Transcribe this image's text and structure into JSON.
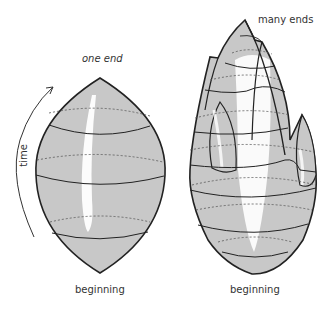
{
  "left_figure": {
    "top_label": "one end",
    "bottom_label": "beginning",
    "axis_label": "time"
  },
  "right_figure": {
    "top_label": "many ends",
    "bottom_label": "beginning"
  },
  "colors": {
    "fill": "#c8c8c8",
    "highlight": "#ffffff",
    "stroke": "#222222",
    "dashed": "#555555",
    "text": "#333333"
  }
}
